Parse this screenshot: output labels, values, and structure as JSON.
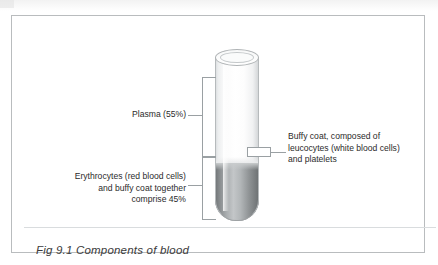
{
  "figure": {
    "caption": "Fig 9.1 Components of blood",
    "diagram_title": "Components of blood"
  },
  "labels": {
    "plasma": "Plasma (55%)",
    "erythrocytes": "Erythrocytes (red blood cells)\nand buffy coat together\ncomprise 45%",
    "buffy_coat": "Buffy coat, composed of\nleucocytes (white blood cells)\nand platelets"
  },
  "diagram_data": {
    "type": "labelled-illustration",
    "subject": "centrifuged blood sample in a test tube",
    "layers": [
      {
        "name": "Plasma",
        "percent": 55,
        "color": "#fdfdfd",
        "position": "upper"
      },
      {
        "name": "Buffy coat (leucocytes and platelets)",
        "percent": null,
        "color": "#c9cccd",
        "position": "interface"
      },
      {
        "name": "Erythrocytes (red blood cells)",
        "percent": 45,
        "color": "#9a9ea0",
        "position": "lower",
        "note": "erythrocytes and buffy coat together comprise 45%"
      }
    ]
  },
  "colors": {
    "frame_border": "#b9bcbe",
    "plasma_fill": "#fdfdfd",
    "cells_fill": "#9a9ea0",
    "leader_line": "#9aa0a3",
    "text": "#2b2b2b",
    "page_background": "#ffffff"
  }
}
